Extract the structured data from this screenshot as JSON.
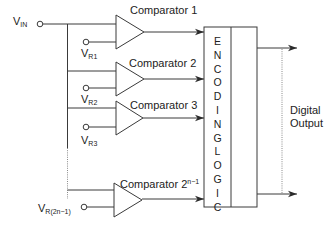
{
  "diagram": {
    "input": {
      "label": "V",
      "sub": "IN"
    },
    "comparators": [
      {
        "label": "Comparator 1",
        "ref_label": "V",
        "ref_sub": "R1"
      },
      {
        "label": "Comparator 2",
        "ref_label": "V",
        "ref_sub": "R2"
      },
      {
        "label": "Comparator 3",
        "ref_label": "V",
        "ref_sub": "R3"
      },
      {
        "label": "Comparator 2",
        "label_sup": "n−1",
        "ref_label": "V",
        "ref_sub": "R(2n−1)"
      }
    ],
    "encoder": {
      "letters": [
        "E",
        "N",
        "C",
        "O",
        "D",
        "I",
        "N",
        "G",
        "",
        "L",
        "O",
        "G",
        "I",
        "C"
      ]
    },
    "output": {
      "line1": "Digital",
      "line2": "Output"
    },
    "colors": {
      "line": "#3a3a3a",
      "dotted": "#8a8a8a",
      "text": "#222222"
    }
  }
}
